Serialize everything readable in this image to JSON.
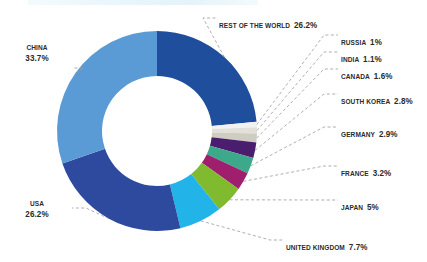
{
  "chart_data": {
    "type": "pie",
    "variant": "donut",
    "title": "",
    "subtitle": "",
    "xlabel": "",
    "ylabel": "",
    "legend_position": "callout-labels",
    "grid": false,
    "units": "%",
    "total": 100,
    "start_angle_deg": 0,
    "direction": "clockwise",
    "categories": [
      "REST OF THE WORLD",
      "RUSSIA",
      "INDIA",
      "CANADA",
      "SOUTH KOREA",
      "GERMANY",
      "FRANCE",
      "JAPAN",
      "UNITED KINGDOM",
      "USA",
      "CHINA"
    ],
    "values": [
      26.2,
      1,
      1.1,
      1.6,
      2.8,
      2.9,
      3.2,
      5,
      7.7,
      26.2,
      33.7
    ],
    "value_labels": [
      "26.2%",
      "1%",
      "1.1%",
      "1.6%",
      "2.8%",
      "2.9%",
      "3.2%",
      "5%",
      "7.7%",
      "26.2%",
      "33.7%"
    ],
    "colors": [
      "#1F4E9C",
      "#F2F2F0",
      "#E2E0D8",
      "#CFCCC2",
      "#4B1D6E",
      "#3DA98B",
      "#A01E6E",
      "#7FBA2F",
      "#22B3E8",
      "#2E4A9E",
      "#5B9BD5"
    ],
    "slices": [
      {
        "label": "REST OF THE WORLD",
        "value": 26.2,
        "value_label": "26.2%",
        "color": "#1F4E9C"
      },
      {
        "label": "RUSSIA",
        "value": 1,
        "value_label": "1%",
        "color": "#F2F2F0"
      },
      {
        "label": "INDIA",
        "value": 1.1,
        "value_label": "1.1%",
        "color": "#E2E0D8"
      },
      {
        "label": "CANADA",
        "value": 1.6,
        "value_label": "1.6%",
        "color": "#CFCCC2"
      },
      {
        "label": "SOUTH KOREA",
        "value": 2.8,
        "value_label": "2.8%",
        "color": "#4B1D6E"
      },
      {
        "label": "GERMANY",
        "value": 2.9,
        "value_label": "2.9%",
        "color": "#3DA98B"
      },
      {
        "label": "FRANCE",
        "value": 3.2,
        "value_label": "3.2%",
        "color": "#A01E6E"
      },
      {
        "label": "JAPAN",
        "value": 5,
        "value_label": "5%",
        "color": "#7FBA2F"
      },
      {
        "label": "UNITED KINGDOM",
        "value": 7.7,
        "value_label": "7.7%",
        "color": "#22B3E8"
      },
      {
        "label": "USA",
        "value": 26.2,
        "value_label": "26.2%",
        "color": "#2E4A9E"
      },
      {
        "label": "CHINA",
        "value": 33.7,
        "value_label": "33.7%",
        "color": "#5B9BD5"
      }
    ]
  },
  "labels": {
    "rest_of_world": {
      "name": "REST OF THE WORLD",
      "pct": "26.2%"
    },
    "russia": {
      "name": "RUSSIA",
      "pct": "1%"
    },
    "india": {
      "name": "INDIA",
      "pct": "1.1%"
    },
    "canada": {
      "name": "CANADA",
      "pct": "1.6%"
    },
    "south_korea": {
      "name": "SOUTH KOREA",
      "pct": "2.8%"
    },
    "germany": {
      "name": "GERMANY",
      "pct": "2.9%"
    },
    "france": {
      "name": "FRANCE",
      "pct": "3.2%"
    },
    "japan": {
      "name": "JAPAN",
      "pct": "5%"
    },
    "united_kingdom": {
      "name": "UNITED KINGDOM",
      "pct": "7.7%"
    },
    "usa": {
      "name": "USA",
      "pct": "26.2%"
    },
    "china": {
      "name": "CHINA",
      "pct": "33.7%"
    }
  },
  "style": {
    "leader_line_color": "#9a9a9a",
    "label_color": "#2b2b2b",
    "background": "#ffffff"
  }
}
